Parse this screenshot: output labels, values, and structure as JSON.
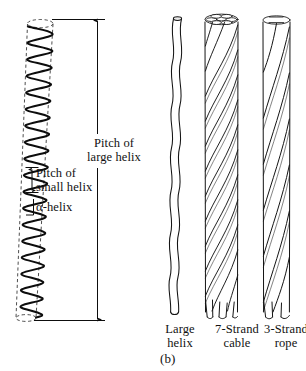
{
  "figure": {
    "caption": "(b)",
    "panel_letter": "b"
  },
  "left_diagram": {
    "name": "coiled-coil-alpha-helix",
    "annotations": {
      "pitch_large_line1": "Pitch of",
      "pitch_large_line2": "large helix",
      "pitch_large_full": "Pitch of large helix",
      "pitch_small_line1": "Pitch of",
      "pitch_small_line2": "small helix",
      "pitch_small_full": "Pitch of small helix",
      "alpha_helix": "α-helix"
    },
    "geometry": {
      "coil_turns": 17,
      "top_x": 40,
      "top_y": 22,
      "bottom_x": 26,
      "bottom_y": 320,
      "top_radius": 13,
      "bottom_radius": 10
    }
  },
  "right_diagram": {
    "items": [
      {
        "id": "large-helix",
        "label_line1": "Large",
        "label_line2": "helix",
        "label_full": "Large helix",
        "strands": 1
      },
      {
        "id": "seven-strand-cable",
        "label_line1": "7-Strand",
        "label_line2": "cable",
        "label_full": "7-Strand cable",
        "strands": 7
      },
      {
        "id": "three-strand-rope",
        "label_line1": "3-Strand",
        "label_line2": "rope",
        "label_full": "3-Strand rope",
        "strands": 3
      }
    ]
  },
  "colors": {
    "ink": "#000000",
    "line": "#1a1a1a",
    "dashed": "#333333",
    "background": "#ffffff"
  }
}
